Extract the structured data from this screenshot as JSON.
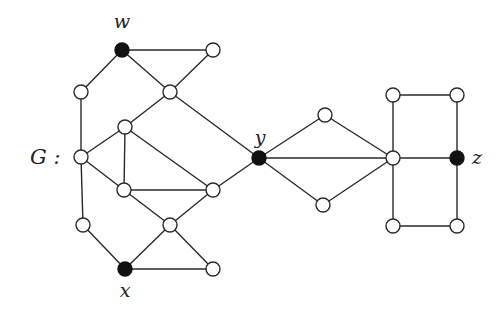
{
  "graph": {
    "name_label": "G :",
    "node_radius": 7,
    "nodes": [
      {
        "id": "w",
        "x": 122,
        "y": 50,
        "filled": true,
        "label": "w",
        "label_dx": 0,
        "label_dy": -22
      },
      {
        "id": "a",
        "x": 213,
        "y": 50,
        "filled": false,
        "label": ""
      },
      {
        "id": "b",
        "x": 81,
        "y": 92,
        "filled": false,
        "label": ""
      },
      {
        "id": "c",
        "x": 170,
        "y": 92,
        "filled": false,
        "label": ""
      },
      {
        "id": "d",
        "x": 125,
        "y": 127,
        "filled": false,
        "label": ""
      },
      {
        "id": "e",
        "x": 81,
        "y": 157,
        "filled": false,
        "label": ""
      },
      {
        "id": "f",
        "x": 124,
        "y": 190,
        "filled": false,
        "label": ""
      },
      {
        "id": "g",
        "x": 213,
        "y": 190,
        "filled": false,
        "label": ""
      },
      {
        "id": "h",
        "x": 83,
        "y": 225,
        "filled": false,
        "label": ""
      },
      {
        "id": "i",
        "x": 170,
        "y": 225,
        "filled": false,
        "label": ""
      },
      {
        "id": "x",
        "x": 125,
        "y": 269,
        "filled": true,
        "label": "x",
        "label_dx": 0,
        "label_dy": 28
      },
      {
        "id": "j",
        "x": 213,
        "y": 269,
        "filled": false,
        "label": ""
      },
      {
        "id": "y",
        "x": 259,
        "y": 158,
        "filled": true,
        "label": "y",
        "label_dx": 1,
        "label_dy": -14
      },
      {
        "id": "k",
        "x": 325,
        "y": 115,
        "filled": false,
        "label": ""
      },
      {
        "id": "l",
        "x": 323,
        "y": 205,
        "filled": false,
        "label": ""
      },
      {
        "id": "m",
        "x": 393,
        "y": 158,
        "filled": false,
        "label": ""
      },
      {
        "id": "n",
        "x": 393,
        "y": 95,
        "filled": false,
        "label": ""
      },
      {
        "id": "o",
        "x": 457,
        "y": 95,
        "filled": false,
        "label": ""
      },
      {
        "id": "z",
        "x": 457,
        "y": 158,
        "filled": true,
        "label": "z",
        "label_dx": 20,
        "label_dy": 6
      },
      {
        "id": "p",
        "x": 393,
        "y": 226,
        "filled": false,
        "label": ""
      },
      {
        "id": "q",
        "x": 457,
        "y": 226,
        "filled": false,
        "label": ""
      }
    ],
    "edges": [
      [
        "w",
        "a"
      ],
      [
        "w",
        "b"
      ],
      [
        "w",
        "c"
      ],
      [
        "a",
        "c"
      ],
      [
        "c",
        "d"
      ],
      [
        "c",
        "y"
      ],
      [
        "b",
        "e"
      ],
      [
        "d",
        "e"
      ],
      [
        "d",
        "f"
      ],
      [
        "d",
        "g"
      ],
      [
        "e",
        "f"
      ],
      [
        "e",
        "h"
      ],
      [
        "f",
        "g"
      ],
      [
        "f",
        "i"
      ],
      [
        "g",
        "i"
      ],
      [
        "g",
        "y"
      ],
      [
        "h",
        "x"
      ],
      [
        "i",
        "x"
      ],
      [
        "i",
        "j"
      ],
      [
        "x",
        "j"
      ],
      [
        "y",
        "k"
      ],
      [
        "y",
        "l"
      ],
      [
        "y",
        "m"
      ],
      [
        "k",
        "m"
      ],
      [
        "l",
        "m"
      ],
      [
        "m",
        "n"
      ],
      [
        "n",
        "o"
      ],
      [
        "o",
        "z"
      ],
      [
        "m",
        "z"
      ],
      [
        "m",
        "p"
      ],
      [
        "p",
        "q"
      ],
      [
        "q",
        "z"
      ]
    ]
  }
}
